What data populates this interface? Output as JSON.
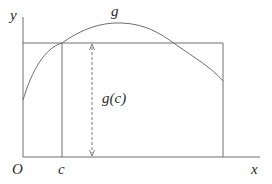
{
  "diagram": {
    "title": "",
    "colors": {
      "background": "#ffffff",
      "line": "#6e6e6e",
      "text": "#2a2a2a"
    },
    "labels": {
      "y_axis": "y",
      "x_axis": "x",
      "origin": "O",
      "point_c": "c",
      "curve": "g",
      "height": "g(c)"
    },
    "elements": {
      "axes": [
        "x-axis",
        "y-axis"
      ],
      "curve": "concave-down curve g rising from y-axis, peaking, then falling to right edge of rectangle",
      "rectangle": "horizontal line at height g(c) spanning from y-axis to right bound, with vertical right edge down to x-axis",
      "vertical_line_c": "vertical line at x=c from x-axis up to the curve",
      "dimension_arrow": "dashed double-headed vertical arrow indicating height g(c)"
    }
  }
}
